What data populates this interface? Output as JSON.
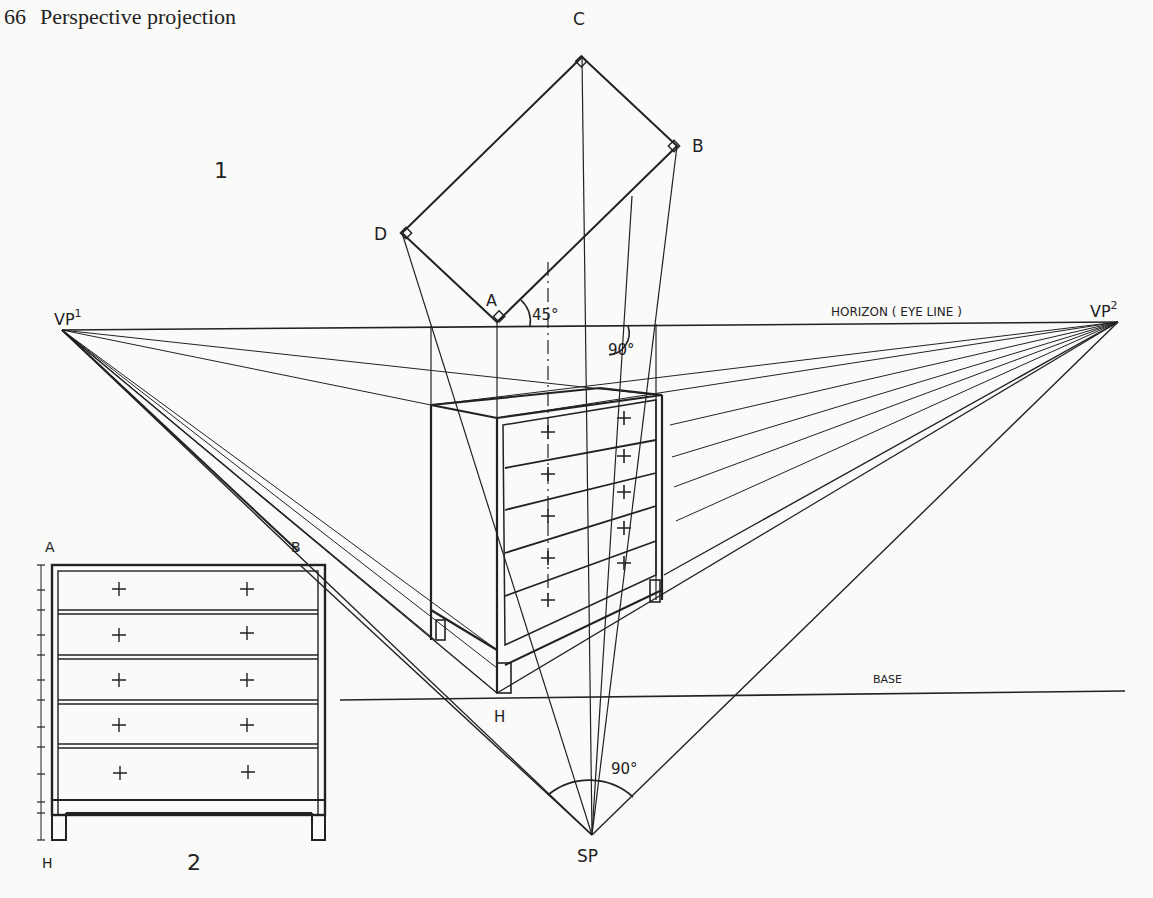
{
  "page": {
    "number": "66",
    "running_title": "Perspective projection"
  },
  "figure": {
    "view1_label": "1",
    "view2_label": "2",
    "plan_points": {
      "A": "A",
      "B": "B",
      "C": "C",
      "D": "D"
    },
    "vp1": {
      "base": "VP",
      "sup": "1"
    },
    "vp2": {
      "base": "VP",
      "sup": "2"
    },
    "horizon_label": "HORIZON ( EYE LINE )",
    "base_label": "BASE",
    "height_point": "H",
    "station_point": "SP",
    "angle_plan": "45°",
    "angle_horizon": "90°",
    "angle_sp": "90°",
    "elevation_labels": {
      "top_left": "A",
      "top_right": "B",
      "bottom_left": "H"
    }
  }
}
